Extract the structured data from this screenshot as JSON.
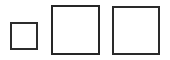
{
  "canvas": {
    "width": 170,
    "height": 60,
    "background_color": "#ffffff"
  },
  "diagram": {
    "shape_count": 3,
    "shape_kind": "square",
    "stroke_color": "#2a2a2a",
    "fill_color": "#ffffff",
    "alignment": "bottom-aligned row, left to right, increasing size"
  },
  "shapes": [
    {
      "name": "small-square",
      "label": "small",
      "order": 1,
      "x": 10,
      "y": 22,
      "width": 28,
      "height": 28,
      "stroke_width": 2,
      "stroke_color": "#2c2c2c",
      "fill_color": "#ffffff"
    },
    {
      "name": "medium-square",
      "label": "medium",
      "order": 2,
      "x": 51,
      "y": 5,
      "width": 49,
      "height": 50,
      "stroke_width": 2,
      "stroke_color": "#262626",
      "fill_color": "#ffffff"
    },
    {
      "name": "large-square",
      "label": "large",
      "order": 3,
      "x": 112,
      "y": 6,
      "width": 48,
      "height": 49,
      "stroke_width": 2,
      "stroke_color": "#2a2a2a",
      "fill_color": "#ffffff"
    }
  ]
}
